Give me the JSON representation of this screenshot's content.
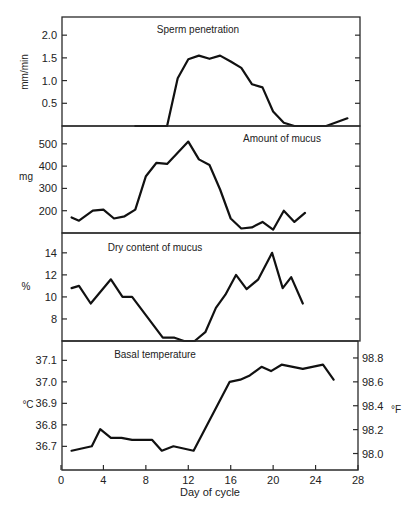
{
  "figure": {
    "xlabel": "Day of cycle",
    "xticks": [
      0,
      4,
      8,
      12,
      16,
      20,
      24,
      28
    ]
  },
  "chart_data": [
    {
      "type": "line",
      "title": "Sperm penetration",
      "xlabel": "Day of cycle",
      "ylabel": "mm/min",
      "xlim": [
        0,
        28
      ],
      "ylim": [
        0,
        2.4
      ],
      "yticks": [
        0.5,
        1.0,
        1.5,
        2.0
      ],
      "ytick_labels": [
        "0.5",
        "1.0",
        "1.5",
        "2.0"
      ],
      "grid": false,
      "x": [
        7,
        10,
        11,
        12,
        13,
        14,
        15,
        16,
        17,
        18,
        19,
        20,
        21,
        22,
        25,
        27
      ],
      "y": [
        0,
        0,
        1.05,
        1.47,
        1.55,
        1.48,
        1.55,
        1.42,
        1.28,
        0.92,
        0.85,
        0.32,
        0.07,
        0,
        0,
        0.17
      ]
    },
    {
      "type": "line",
      "title": "Amount of mucus",
      "xlabel": "Day of cycle",
      "ylabel": "mg",
      "xlim": [
        0,
        28
      ],
      "ylim": [
        100,
        580
      ],
      "yticks": [
        200,
        300,
        400,
        500
      ],
      "ytick_labels": [
        "200",
        "300",
        "400",
        "500"
      ],
      "grid": false,
      "x": [
        1,
        1.7,
        3,
        4,
        5,
        6,
        7,
        8,
        9,
        10,
        11,
        12,
        13,
        14,
        15,
        16,
        17,
        18,
        19,
        20,
        21,
        22,
        23
      ],
      "y": [
        170,
        155,
        200,
        205,
        165,
        175,
        205,
        355,
        415,
        410,
        460,
        510,
        430,
        405,
        295,
        165,
        120,
        125,
        150,
        115,
        200,
        150,
        190
      ]
    },
    {
      "type": "line",
      "title": "Dry content of mucus",
      "xlabel": "Day of cycle",
      "ylabel": "%",
      "xlim": [
        0,
        28
      ],
      "ylim": [
        6,
        15.8
      ],
      "yticks": [
        8,
        10,
        12,
        14
      ],
      "ytick_labels": [
        "8",
        "10",
        "12",
        "14"
      ],
      "grid": false,
      "x": [
        1,
        1.7,
        2.8,
        4.7,
        5.8,
        6.7,
        9.6,
        10.7,
        11.6,
        12.6,
        13.6,
        14.6,
        15.5,
        16.5,
        17.5,
        18.6,
        19.9,
        20.9,
        21.7,
        22.8
      ],
      "y": [
        10.8,
        11.0,
        9.4,
        11.6,
        10.0,
        10.0,
        6.3,
        6.3,
        6.0,
        6.0,
        6.8,
        9.0,
        10.2,
        12.0,
        10.7,
        11.6,
        14.0,
        10.8,
        11.8,
        9.4
      ]
    },
    {
      "type": "line",
      "title": "Basal temperature",
      "xlabel": "Day of cycle",
      "ylabel": "°C",
      "ylabel_right": "°F",
      "xlim": [
        0,
        28
      ],
      "ylim": [
        36.59,
        37.19
      ],
      "yticks": [
        36.7,
        36.8,
        36.9,
        37.0,
        37.1
      ],
      "ytick_labels": [
        "36.7",
        "36.8",
        "36.9",
        "37.0",
        "37.1"
      ],
      "yticks_right": [
        98.0,
        98.2,
        98.4,
        98.6,
        98.8
      ],
      "ytick_labels_right": [
        "98.0",
        "98.2",
        "98.4",
        "98.6",
        "98.8"
      ],
      "xticks": [
        0,
        4,
        8,
        12,
        16,
        20,
        24,
        28
      ],
      "xtick_labels": [
        "0",
        "4",
        "8",
        "12",
        "16",
        "20",
        "24",
        "28"
      ],
      "grid": false,
      "x": [
        1,
        2.9,
        3.7,
        4.7,
        5.7,
        6.7,
        8.6,
        9.5,
        10.6,
        12.5,
        15.9,
        16.9,
        17.8,
        18.9,
        19.8,
        20.8,
        22.8,
        24.7,
        25.7
      ],
      "y": [
        36.68,
        36.7,
        36.78,
        36.74,
        36.74,
        36.73,
        36.73,
        36.68,
        36.7,
        36.68,
        37.0,
        37.01,
        37.03,
        37.07,
        37.05,
        37.08,
        37.06,
        37.08,
        37.01
      ]
    }
  ]
}
